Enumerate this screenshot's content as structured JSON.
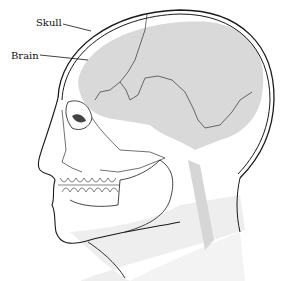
{
  "diagram": {
    "labels": [
      {
        "id": "skull",
        "text": "Skull",
        "x": 36,
        "y": 18
      },
      {
        "id": "brain",
        "text": "Brain",
        "x": 11,
        "y": 51
      }
    ],
    "colors": {
      "background": "#ffffff",
      "brain_fill": "#d9d9d9",
      "skin_shade": "#ececec",
      "line": "#1a1a1a"
    }
  }
}
